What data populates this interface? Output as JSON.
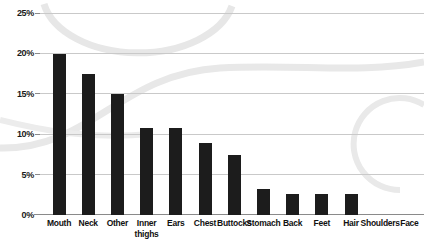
{
  "chart_data": {
    "type": "bar",
    "title": "",
    "subtitle": "",
    "xlabel": "",
    "ylabel": "",
    "ylim": [
      0,
      25
    ],
    "yticks": [
      0,
      5,
      10,
      15,
      20,
      25
    ],
    "ytick_labels": [
      "0%",
      "5%",
      "10%",
      "15%",
      "20%",
      "25%"
    ],
    "grid": true,
    "legend": false,
    "categories": [
      "Mouth",
      "Neck",
      "Other",
      "Inner\nthighs",
      "Ears",
      "Chest",
      "Buttocks",
      "Stomach",
      "Back",
      "Feet",
      "Hair",
      "Shoulders",
      "Face"
    ],
    "values": [
      20.0,
      17.6,
      15.0,
      10.8,
      10.8,
      9.0,
      7.5,
      3.2,
      2.6,
      2.6,
      2.6,
      0,
      0
    ],
    "bar_color": "#1c1c1c",
    "grid_color": "#c9c9c9",
    "axis_color": "#8a8a8a",
    "background_color": "#ffffff",
    "watermark_color": "#e6e6e6"
  }
}
